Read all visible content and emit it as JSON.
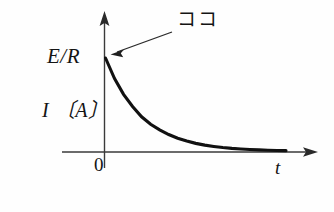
{
  "figure": {
    "kind": "line",
    "background_color": "#fefefe",
    "ink_color": "#141414"
  },
  "labels": {
    "y_axis_value": "E/R",
    "y_axis_quantity": "I 〔A〕",
    "origin": "0",
    "x_axis": "t",
    "annotation": "ココ"
  },
  "chart_data": {
    "type": "line",
    "title": "",
    "subtitle": "",
    "xlabel": "t",
    "ylabel": "I 〔A〕",
    "grid": false,
    "legend": null,
    "annotations": [
      {
        "text": "ココ",
        "points_to": "curve start at t = 0, I = E/R",
        "arrow": true
      }
    ],
    "axes": {
      "x": {
        "min": 0,
        "max": 1,
        "ticks": [
          0
        ],
        "ticklabels": [
          "0"
        ],
        "arrowhead": true
      },
      "y": {
        "min": 0,
        "max": 1.15,
        "ticks": [
          1
        ],
        "ticklabels": [
          "E/R"
        ],
        "arrowhead": true
      }
    },
    "series": [
      {
        "name": "I(t) = (E/R) e^(-t/τ)",
        "equation": "exponential decay",
        "x": [
          0.0,
          0.05,
          0.1,
          0.15,
          0.2,
          0.25,
          0.3,
          0.35,
          0.4,
          0.45,
          0.5,
          0.55,
          0.6,
          0.65,
          0.7,
          0.75,
          0.8,
          0.85,
          0.9,
          0.95,
          1.0
        ],
        "y": [
          1.0,
          0.78,
          0.61,
          0.48,
          0.37,
          0.29,
          0.23,
          0.18,
          0.14,
          0.11,
          0.085,
          0.066,
          0.052,
          0.04,
          0.031,
          0.025,
          0.019,
          0.015,
          0.012,
          0.009,
          0.007
        ]
      }
    ]
  }
}
